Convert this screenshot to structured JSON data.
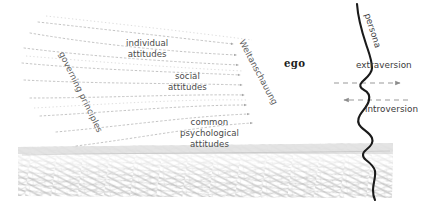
{
  "figure": {
    "title_alt": "Jungian psyche diagram: conscious layers above the unconscious, with ego, persona and attitude axes",
    "background_color": "#ffffff",
    "ink_color": "#4a4a4a",
    "dark_ink_color": "#1c1c1c",
    "texture_color": "#9a9a9a"
  },
  "labels": {
    "individual_attitudes": {
      "line1": "individual",
      "line2": "attitudes",
      "x": 128,
      "y": 40
    },
    "social_attitudes": {
      "line1": "social",
      "line2": "attitudes",
      "x": 168,
      "y": 73
    },
    "common_psychological_attitudes": {
      "line1": "common",
      "line2": "psychological",
      "line3": "attitudes",
      "x": 183,
      "y": 119
    },
    "governing_principles": {
      "text": "governing principles",
      "rotation_deg": 64
    },
    "weltanschauung": {
      "text": "Weltanschauung",
      "rotation_deg": 62
    },
    "ego": {
      "text": "ego",
      "x": 286,
      "y": 60
    },
    "persona": {
      "text": "persona",
      "rotation_deg": 72
    },
    "extraversion": {
      "text": "extraversion",
      "x": 356,
      "y": 64
    },
    "introversion": {
      "text": "introversion",
      "x": 365,
      "y": 108
    }
  },
  "arrows": {
    "extraversion_arrow": {
      "direction": "right",
      "style": "dashed",
      "y": 83
    },
    "introversion_arrow": {
      "direction": "left",
      "style": "dashed",
      "y": 100
    },
    "flow_arrows": {
      "count": 9,
      "direction": "right",
      "style": "dotted",
      "description": "dotted curves sweeping from upper-left toward the ego"
    }
  },
  "regions": {
    "conscious": {
      "name": "conscious field",
      "fill": "#ffffff"
    },
    "unconscious": {
      "name": "unconscious",
      "fill": "#a8a8a8",
      "texture": "pencil-scribble",
      "top_y": 140
    }
  },
  "profile": {
    "name": "head-profile-silhouette",
    "stroke": "#1a1a1a",
    "stroke_width": 2.1
  }
}
